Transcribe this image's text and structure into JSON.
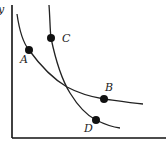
{
  "diagram": {
    "type": "indifference-curves",
    "axes": {
      "y_label": "y",
      "x_label": ""
    },
    "curves": [
      {
        "name": "curve-1",
        "through": [
          "A",
          "B"
        ]
      },
      {
        "name": "curve-2",
        "through": [
          "C",
          "D"
        ]
      }
    ],
    "points": [
      {
        "label": "A",
        "x": 29,
        "y": 50,
        "lx": 21,
        "ly": 63
      },
      {
        "label": "B",
        "x": 104,
        "y": 99,
        "lx": 105,
        "ly": 91
      },
      {
        "label": "C",
        "x": 51,
        "y": 38,
        "lx": 62,
        "ly": 42
      },
      {
        "label": "D",
        "x": 96,
        "y": 120,
        "lx": 84,
        "ly": 132
      }
    ],
    "colors": {
      "line": "#222222",
      "point": "#111111",
      "background": "#ffffff"
    }
  }
}
